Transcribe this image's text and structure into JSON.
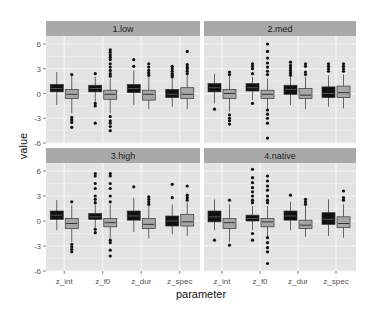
{
  "chart_data": {
    "type": "boxplot",
    "title": "",
    "xlabel": "parameter",
    "ylabel": "value",
    "ylim": [
      -6,
      6
    ],
    "yticks": [
      6,
      3,
      0,
      -3,
      -6
    ],
    "categories": [
      "z_int",
      "z_f0",
      "z_dur",
      "z_spec"
    ],
    "grid": true,
    "legend": null,
    "series_colors": {
      "series1": "#111111",
      "series2": "#a6a6a6"
    },
    "facets": [
      {
        "label": "1.low",
        "boxes": [
          {
            "parameter": "z_int",
            "series": 1,
            "q1": 0.2,
            "median": 0.6,
            "q3": 1.1,
            "lo": -1.4,
            "hi": 2.6,
            "outliers": []
          },
          {
            "parameter": "z_int",
            "series": 2,
            "q1": -0.6,
            "median": -0.1,
            "q3": 0.5,
            "lo": -2.4,
            "hi": 2.2,
            "outliers": [
              2.3,
              -2.9,
              -3.2,
              -3.5,
              -4.1
            ]
          },
          {
            "parameter": "z_f0",
            "series": 1,
            "q1": 0.2,
            "median": 0.6,
            "q3": 1.0,
            "lo": -1.0,
            "hi": 2.0,
            "outliers": [
              2.4,
              -1.2,
              -1.5,
              -3.6
            ]
          },
          {
            "parameter": "z_f0",
            "series": 2,
            "q1": -0.7,
            "median": -0.1,
            "q3": 0.4,
            "lo": -2.4,
            "hi": 1.8,
            "outliers": [
              5.3,
              5.0,
              4.7,
              4.4,
              4.1,
              3.6,
              3.2,
              2.8,
              2.4,
              2.1,
              -2.8,
              -3.3,
              -3.6,
              -4.0,
              -4.5
            ]
          },
          {
            "parameter": "z_dur",
            "series": 1,
            "q1": 0.1,
            "median": 0.6,
            "q3": 1.1,
            "lo": -1.4,
            "hi": 2.8,
            "outliers": [
              4.1,
              3.3
            ]
          },
          {
            "parameter": "z_dur",
            "series": 2,
            "q1": -0.8,
            "median": -0.1,
            "q3": 0.4,
            "lo": -1.9,
            "hi": 2.0,
            "outliers": [
              3.6,
              3.2,
              2.8,
              2.5,
              2.2
            ]
          },
          {
            "parameter": "z_spec",
            "series": 1,
            "q1": -0.5,
            "median": -0.1,
            "q3": 0.5,
            "lo": -1.6,
            "hi": 1.8,
            "outliers": [
              3.3,
              3.0,
              2.7,
              2.4,
              2.2,
              2.0
            ]
          },
          {
            "parameter": "z_spec",
            "series": 2,
            "q1": -0.6,
            "median": -0.1,
            "q3": 0.7,
            "lo": -1.9,
            "hi": 2.2,
            "outliers": [
              5.1,
              3.5,
              3.2,
              3.0,
              2.7,
              2.4
            ]
          }
        ]
      },
      {
        "label": "2.med",
        "boxes": [
          {
            "parameter": "z_int",
            "series": 1,
            "q1": 0.2,
            "median": 0.7,
            "q3": 1.2,
            "lo": -1.2,
            "hi": 2.4,
            "outliers": [
              -1.9
            ]
          },
          {
            "parameter": "z_int",
            "series": 2,
            "q1": -0.6,
            "median": 0.0,
            "q3": 0.5,
            "lo": -2.2,
            "hi": 2.1,
            "outliers": [
              2.6,
              2.3,
              -2.6,
              -3.0,
              -3.3,
              -3.7
            ]
          },
          {
            "parameter": "z_f0",
            "series": 1,
            "q1": 0.3,
            "median": 0.7,
            "q3": 1.2,
            "lo": -0.8,
            "hi": 2.0,
            "outliers": [
              3.6,
              3.3,
              3.0,
              2.4,
              -1.2
            ]
          },
          {
            "parameter": "z_f0",
            "series": 2,
            "q1": -0.6,
            "median": -0.1,
            "q3": 0.4,
            "lo": -2.0,
            "hi": 1.8,
            "outliers": [
              6.0,
              5.1,
              4.3,
              3.7,
              3.2,
              2.7,
              2.3,
              -2.0,
              -2.5,
              -3.0,
              -3.6,
              -5.4
            ]
          },
          {
            "parameter": "z_dur",
            "series": 1,
            "q1": -0.1,
            "median": 0.5,
            "q3": 1.0,
            "lo": -1.4,
            "hi": 2.0,
            "outliers": [
              3.8,
              3.4,
              3.1,
              2.8,
              2.5,
              2.2
            ]
          },
          {
            "parameter": "z_dur",
            "series": 2,
            "q1": -0.6,
            "median": -0.2,
            "q3": 0.6,
            "lo": -1.9,
            "hi": 2.0,
            "outliers": [
              3.6,
              3.3,
              2.6,
              2.3
            ]
          },
          {
            "parameter": "z_spec",
            "series": 1,
            "q1": -0.5,
            "median": 0.0,
            "q3": 0.8,
            "lo": -1.6,
            "hi": 2.2,
            "outliers": [
              3.6,
              3.3,
              3.0,
              2.7
            ]
          },
          {
            "parameter": "z_spec",
            "series": 2,
            "q1": -0.5,
            "median": 0.1,
            "q3": 0.9,
            "lo": -1.8,
            "hi": 2.3,
            "outliers": [
              3.6,
              3.3,
              3.0,
              2.7
            ]
          }
        ]
      },
      {
        "label": "3.high",
        "boxes": [
          {
            "parameter": "z_int",
            "series": 1,
            "q1": 0.2,
            "median": 0.7,
            "q3": 1.2,
            "lo": -1.1,
            "hi": 2.5,
            "outliers": []
          },
          {
            "parameter": "z_int",
            "series": 2,
            "q1": -0.9,
            "median": -0.3,
            "q3": 0.3,
            "lo": -2.5,
            "hi": 1.9,
            "outliers": [
              2.3,
              -2.8,
              -3.1,
              -3.4,
              -3.7
            ]
          },
          {
            "parameter": "z_f0",
            "series": 1,
            "q1": 0.2,
            "median": 0.5,
            "q3": 0.9,
            "lo": -0.8,
            "hi": 2.0,
            "outliers": [
              5.7,
              5.4,
              4.5,
              3.9,
              3.0,
              2.6,
              2.2,
              -1.0,
              -1.4
            ]
          },
          {
            "parameter": "z_f0",
            "series": 2,
            "q1": -0.7,
            "median": -0.2,
            "q3": 0.3,
            "lo": -2.1,
            "hi": 2.0,
            "outliers": [
              5.7,
              5.4,
              4.5,
              3.9,
              3.0,
              2.3,
              -2.3,
              -2.6,
              -3.5,
              -4.2
            ]
          },
          {
            "parameter": "z_dur",
            "series": 1,
            "q1": 0.1,
            "median": 0.6,
            "q3": 1.2,
            "lo": -1.3,
            "hi": 2.8,
            "outliers": [
              4.1
            ]
          },
          {
            "parameter": "z_dur",
            "series": 2,
            "q1": -0.9,
            "median": -0.4,
            "q3": 0.3,
            "lo": -2.1,
            "hi": 1.8,
            "outliers": [
              2.9,
              2.6,
              2.3,
              2.0
            ]
          },
          {
            "parameter": "z_spec",
            "series": 1,
            "q1": -0.6,
            "median": 0.0,
            "q3": 0.6,
            "lo": -1.6,
            "hi": 2.0,
            "outliers": [
              4.4,
              2.8
            ]
          },
          {
            "parameter": "z_spec",
            "series": 2,
            "q1": -0.6,
            "median": -0.1,
            "q3": 0.8,
            "lo": -1.8,
            "hi": 2.2,
            "outliers": [
              4.2,
              3.1,
              2.8,
              2.5
            ]
          }
        ]
      },
      {
        "label": "4.native",
        "boxes": [
          {
            "parameter": "z_int",
            "series": 1,
            "q1": -0.1,
            "median": 0.5,
            "q3": 1.2,
            "lo": -1.1,
            "hi": 2.6,
            "outliers": [
              -2.3
            ]
          },
          {
            "parameter": "z_int",
            "series": 2,
            "q1": -0.9,
            "median": -0.2,
            "q3": 0.3,
            "lo": -2.5,
            "hi": 2.0,
            "outliers": [
              2.5,
              -2.9
            ]
          },
          {
            "parameter": "z_f0",
            "series": 1,
            "q1": 0.0,
            "median": 0.3,
            "q3": 0.7,
            "lo": -1.1,
            "hi": 1.8,
            "outliers": [
              6.2,
              5.2,
              4.6,
              4.0,
              3.5,
              3.0,
              2.5,
              2.2,
              -1.5,
              -2.3
            ]
          },
          {
            "parameter": "z_f0",
            "series": 2,
            "q1": -0.7,
            "median": -0.1,
            "q3": 0.3,
            "lo": -1.8,
            "hi": 1.8,
            "outliers": [
              5.4,
              4.8,
              4.2,
              3.7,
              3.0,
              2.5,
              2.2,
              -2.0,
              -2.6,
              -3.2,
              -3.7,
              -5.1
            ]
          },
          {
            "parameter": "z_dur",
            "series": 1,
            "q1": 0.1,
            "median": 0.6,
            "q3": 1.2,
            "lo": -1.1,
            "hi": 2.3,
            "outliers": [
              3.1
            ]
          },
          {
            "parameter": "z_dur",
            "series": 2,
            "q1": -0.9,
            "median": -0.5,
            "q3": 0.1,
            "lo": -1.9,
            "hi": 1.9,
            "outliers": [
              2.6,
              2.3,
              2.0
            ]
          },
          {
            "parameter": "z_spec",
            "series": 1,
            "q1": -0.4,
            "median": 0.2,
            "q3": 1.0,
            "lo": -1.8,
            "hi": 2.6,
            "outliers": []
          },
          {
            "parameter": "z_spec",
            "series": 2,
            "q1": -0.8,
            "median": -0.3,
            "q3": 0.5,
            "lo": -2.0,
            "hi": 2.0,
            "outliers": [
              3.6,
              2.8,
              2.5
            ]
          }
        ]
      }
    ]
  },
  "axes": {
    "x_title": "parameter",
    "y_title": "value",
    "ytick_labels": [
      "6",
      "3",
      "0",
      "-3",
      "-6"
    ],
    "xtick_labels": [
      "z_int",
      "z_f0",
      "z_dur",
      "z_spec"
    ]
  },
  "facets": {
    "labels": [
      "1.low",
      "2.med",
      "3.high",
      "4.native"
    ]
  },
  "colors": {
    "panel_bg": "#e3e3e3",
    "grid_major": "#f5f5f5",
    "grid_minor": "#ececec",
    "strip_bg": "#a9a9a9",
    "box_dark": "#111111",
    "box_light": "#a6a6a6",
    "whisker": "#555555"
  }
}
